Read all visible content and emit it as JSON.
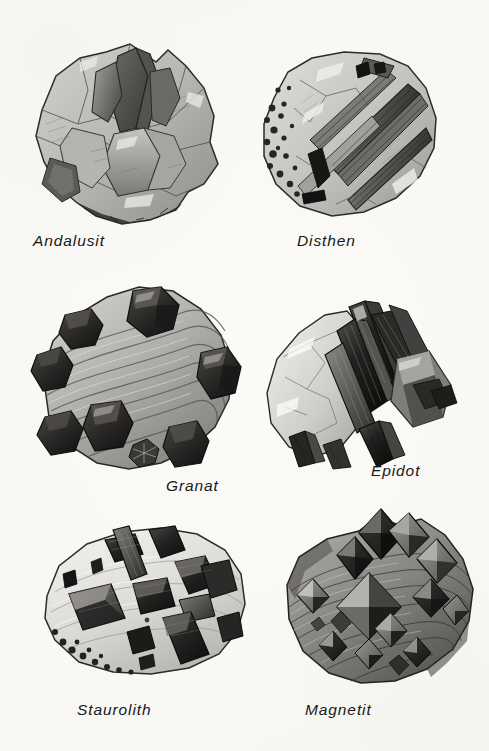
{
  "plate": {
    "background_color": "#fbfaf7",
    "ink_color": "#17181a",
    "columns": 2,
    "rows": 3
  },
  "specimens": [
    {
      "id": "andalusit",
      "label": "Andalusit",
      "habit": "stout prismatic crystals in light rock matrix",
      "tone": "medium gray"
    },
    {
      "id": "disthen",
      "label": "Disthen",
      "habit": "bladed elongated crystals across a rounded matrix",
      "tone": "light gray with dark blades"
    },
    {
      "id": "granat",
      "label": "Granat",
      "habit": "dark dodecahedral crystals embedded in foliated schist",
      "tone": "dark crystals on light banded matrix"
    },
    {
      "id": "epidot",
      "label": "Epidot",
      "habit": "dark slender prismatic crystals radiating from pale matrix",
      "tone": "near black prisms on white matrix"
    },
    {
      "id": "staurolith",
      "label": "Staurolith",
      "habit": "dark blocky prisms and cross twin in pale matrix",
      "tone": "dark crystals on very light matrix"
    },
    {
      "id": "magnetit",
      "label": "Magnetit",
      "habit": "octahedral crystals studding a striated dark matrix",
      "tone": "dark gray matrix with faceted octahedra"
    }
  ]
}
